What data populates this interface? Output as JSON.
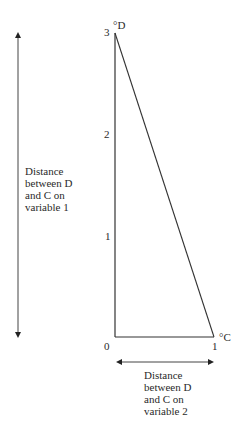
{
  "diagram": {
    "points": [
      {
        "name": "D",
        "label": "°D",
        "x": 0,
        "y": 3
      },
      {
        "name": "C",
        "label": "°C",
        "x": 1,
        "y": 0
      }
    ],
    "vertical_ticks": [
      "3",
      "2",
      "1",
      "0"
    ],
    "horizontal_ticks": [
      "0",
      "1"
    ],
    "vertical_arrow_label": "Distance\nbetween D\nand C on\nvariable 1",
    "horizontal_arrow_label": "Distance\nbetween D\nand C on\nvariable 2"
  }
}
